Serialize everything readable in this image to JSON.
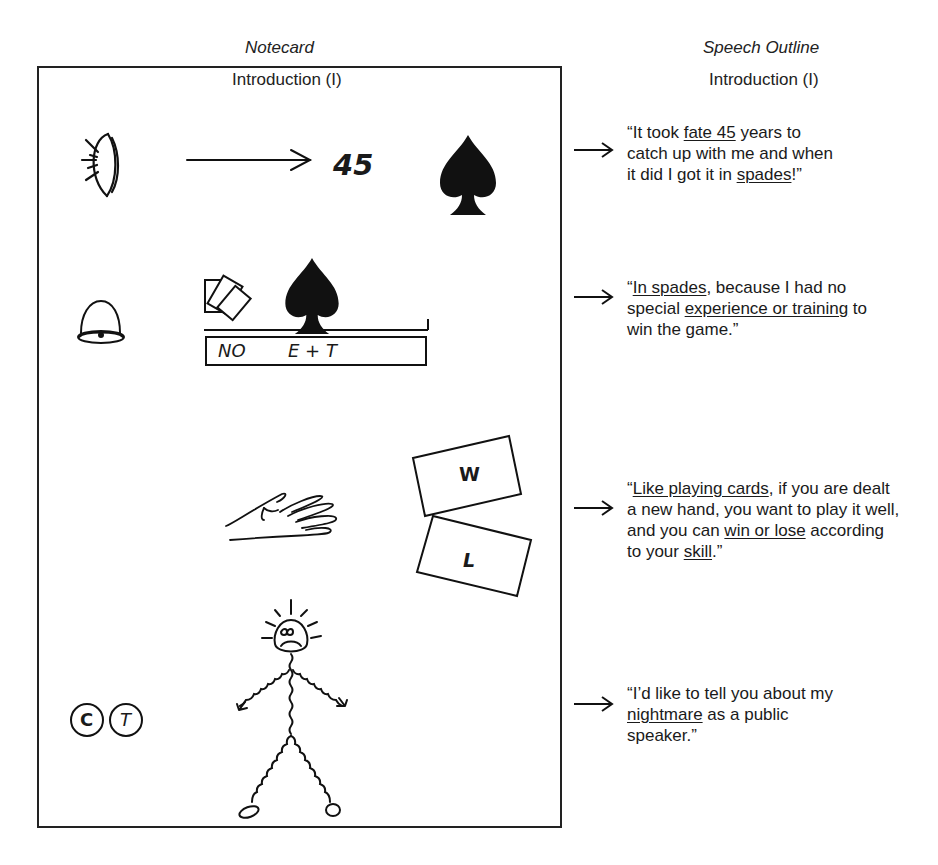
{
  "headers": {
    "notecard": "Notecard",
    "outline": "Speech Outline"
  },
  "notecard": {
    "section": "Introduction (I)",
    "rows": [
      {
        "icons": [
          "eye-icon",
          "arrow-right-icon",
          "spade-icon"
        ],
        "text": "45"
      },
      {
        "icons": [
          "bell-icon",
          "cards-icon",
          "spade-icon"
        ],
        "box_label_1": "NO",
        "box_label_2": "E + T"
      },
      {
        "icons": [
          "hand-icon",
          "card-w-icon",
          "card-l-icon"
        ],
        "card_1": "W",
        "card_2": "L"
      },
      {
        "icons": [
          "circle-c-icon",
          "circle-t-icon",
          "stick-figure-icon"
        ],
        "circle_1": "C",
        "circle_2": "T"
      }
    ]
  },
  "outline": {
    "section": "Introduction (I)",
    "quotes": [
      {
        "parts": [
          "“It took ",
          "fate 45",
          " years to catch up with me and when it did I got it in ",
          "spades",
          "!”"
        ],
        "underlined": [
          1,
          3
        ]
      },
      {
        "parts": [
          "“",
          "In spades",
          ", because I had no special ",
          "experience or training",
          " to win the game.”"
        ],
        "underlined": [
          1,
          3
        ]
      },
      {
        "parts": [
          "“",
          "Like playing cards",
          ", if you are dealt a new hand, you want to play it well, and you can ",
          "win or lose",
          " according to your ",
          "skill",
          ".”"
        ],
        "underlined": [
          1,
          3,
          5
        ]
      },
      {
        "parts": [
          "“I’d like to tell you about my ",
          "nightmare",
          " as a public speaker.”"
        ],
        "underlined": [
          1
        ]
      }
    ]
  }
}
